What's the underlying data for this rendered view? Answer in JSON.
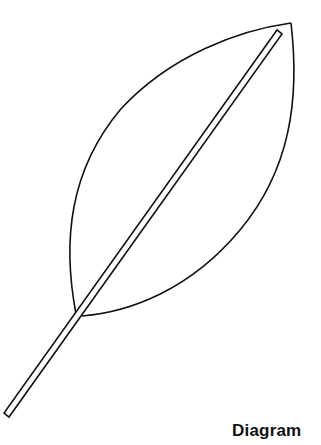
{
  "figure": {
    "caption": "Diagram",
    "stroke_color": "#111111",
    "background": "#ffffff"
  }
}
